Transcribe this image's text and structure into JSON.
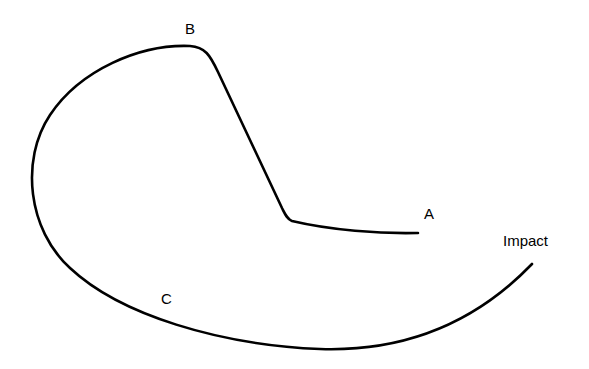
{
  "diagram": {
    "type": "trajectory-path",
    "stroke_color": "#000000",
    "background_color": "#ffffff",
    "labels": {
      "a": "A",
      "b": "B",
      "c": "C",
      "impact": "Impact"
    },
    "path": {
      "description": "Single continuous curve from point A, bending sharply up to peak B, looping around the left side through C, ending at Impact",
      "d": "M 418 233 C 380 234, 330 230, 292 221 C 287 219, 285 214, 282 208 L 218 72 C 210 55, 205 47, 190 46 C 140 44, 80 70, 50 115 C 20 160, 28 230, 70 268 C 120 315, 220 345, 320 349 C 410 352, 480 318, 532 264"
    },
    "anchor_points": [
      {
        "name": "A",
        "x": 418,
        "y": 233
      },
      {
        "name": "corner",
        "x": 290,
        "y": 220
      },
      {
        "name": "B",
        "x": 192,
        "y": 46
      },
      {
        "name": "leftmost",
        "x": 33,
        "y": 180
      },
      {
        "name": "C",
        "x": 160,
        "y": 318
      },
      {
        "name": "bottom",
        "x": 330,
        "y": 349
      },
      {
        "name": "Impact",
        "x": 532,
        "y": 264
      }
    ]
  }
}
